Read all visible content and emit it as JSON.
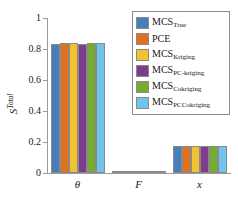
{
  "chart_data": {
    "type": "bar",
    "title": "",
    "xlabel": "",
    "ylabel": "S^Total",
    "ylabel_base": "S",
    "ylabel_sup": "Total",
    "categories": [
      "θ",
      "F",
      "x"
    ],
    "ylim": [
      0,
      1
    ],
    "yticks": [
      0,
      0.2,
      0.4,
      0.6,
      0.8,
      1
    ],
    "ytick_labels": [
      "0",
      "0.2",
      "0.4",
      "0.6",
      "0.8",
      "1"
    ],
    "grid": false,
    "legend_position": "upper right",
    "series": [
      {
        "name": "MCS_True",
        "name_base": "MCS",
        "name_sub": "True",
        "color": "#4A7EBB",
        "values": [
          0.835,
          0.002,
          0.174
        ]
      },
      {
        "name": "PCE",
        "name_base": "PCE",
        "name_sub": "",
        "color": "#E2711D",
        "values": [
          0.836,
          0.002,
          0.175
        ]
      },
      {
        "name": "MCS_Kriging",
        "name_base": "MCS",
        "name_sub": "Kriging",
        "color": "#F2C230",
        "values": [
          0.836,
          0.002,
          0.174
        ]
      },
      {
        "name": "MCS_PC-kriging",
        "name_base": "MCS",
        "name_sub": "PC-kriging",
        "color": "#7D3C8C",
        "values": [
          0.833,
          0.002,
          0.176
        ]
      },
      {
        "name": "MCS_Cokriging",
        "name_base": "MCS",
        "name_sub": "Cokriging",
        "color": "#77AC30",
        "values": [
          0.836,
          0.002,
          0.174
        ]
      },
      {
        "name": "MCS_PCCokriging",
        "name_base": "MCS",
        "name_sub": "PCCokriging",
        "color": "#6FC5EE",
        "values": [
          0.837,
          0.002,
          0.176
        ]
      }
    ]
  }
}
